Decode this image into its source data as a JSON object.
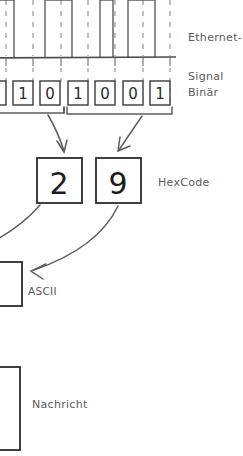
{
  "diagram": {
    "background_color": "#ffffff",
    "line_color": "#555555",
    "box_stroke_color": "#3a3a3a",
    "text_color": "#5a5a5a",
    "digit_color": "#1c1c1c"
  },
  "labels": {
    "ethernet_signal_line1": "Ethernet-",
    "ethernet_signal_line2": "Signal",
    "binary": "Binär",
    "hexcode": "HexCode",
    "ascii": "ASCII",
    "nachricht": "Nachricht"
  },
  "signal": {
    "name": "ethernet-square-wave",
    "baseline_y": 58,
    "high_y": 0,
    "description": "square wave pulses above baseline",
    "gridline_x": [
      6,
      33,
      61,
      88,
      115,
      143,
      170
    ],
    "pulses": [
      {
        "x_start": -6,
        "x_end": 14
      },
      {
        "x_start": 45,
        "x_end": 72
      },
      {
        "x_start": 100,
        "x_end": 113
      },
      {
        "x_start": 128,
        "x_end": 155
      }
    ]
  },
  "binary": {
    "name": "binary-digit-row",
    "digits": [
      "1",
      "0",
      "1",
      "0",
      "0",
      "1"
    ],
    "partial_left_box": true,
    "box_y": 81,
    "box_height": 24,
    "boxes_x": [
      13,
      40,
      68,
      95,
      123,
      150
    ],
    "box_width": 20
  },
  "hexcode": {
    "name": "hex-digit-row",
    "digits": [
      "2",
      "9"
    ],
    "boxes": [
      {
        "x": 37,
        "y": 158,
        "w": 45,
        "h": 45
      },
      {
        "x": 96,
        "y": 158,
        "w": 45,
        "h": 45
      }
    ]
  },
  "ascii": {
    "name": "ascii-box",
    "box": {
      "x": -14,
      "y": 262,
      "w": 36,
      "h": 44
    },
    "value": ""
  },
  "nachricht": {
    "name": "nachricht-box",
    "box": {
      "x": -14,
      "y": 367,
      "w": 34,
      "h": 83
    },
    "value": ""
  },
  "label_positions": {
    "ethernet_signal": {
      "x": 188,
      "y": 6
    },
    "binary": {
      "x": 188,
      "y": 85
    },
    "hexcode": {
      "x": 158,
      "y": 176
    },
    "ascii": {
      "x": 28,
      "y": 285
    },
    "nachricht": {
      "x": 32,
      "y": 399
    }
  }
}
